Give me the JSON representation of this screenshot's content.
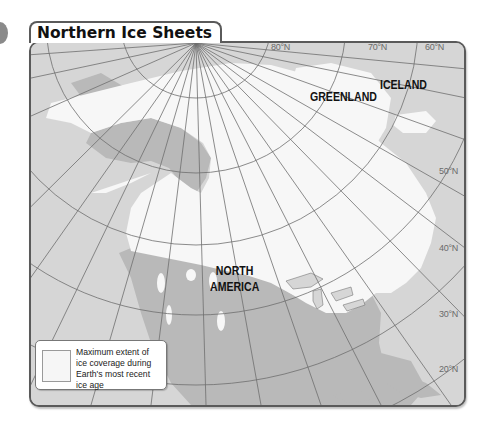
{
  "map": {
    "title": "Northern Ice Sheets",
    "place_labels": {
      "greenland": "GREENLAND",
      "iceland": "ICELAND",
      "north_america_line1": "NORTH",
      "north_america_line2": "AMERICA"
    },
    "latitude_labels": {
      "lat80": "80°N",
      "lat70": "70°N",
      "lat60": "60°N",
      "lat50": "50°N",
      "lat40": "40°N",
      "lat30": "30°N",
      "lat20": "20°N"
    },
    "legend": {
      "text": "Maximum extent of ice coverage during Earth's most recent ice age"
    },
    "colors": {
      "ocean": "#d6d6d6",
      "land": "#b9b9b9",
      "ice": "#f7f7f7",
      "grid": "#6e6e6e",
      "frame": "#5a5a5a"
    }
  }
}
